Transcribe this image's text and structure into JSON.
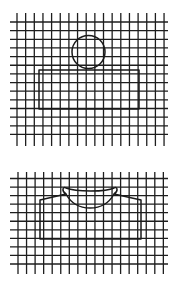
{
  "figures": [
    {
      "name": "circle-over-rectangle",
      "grid": {
        "h_lines": {
          "x1": 10,
          "x2": 168,
          "y_start": 22,
          "count": 14,
          "spacing": 8.65
        },
        "v_lines": {
          "y1": 13,
          "y2": 146,
          "x_start": 17,
          "count": 18,
          "spacing": 8.65
        }
      },
      "circle": {
        "cx": 88.5,
        "cy": 52,
        "r": 16.5
      },
      "rect": {
        "x": 39,
        "y": 70,
        "w": 100,
        "h": 39
      }
    },
    {
      "name": "garment-shape",
      "grid": {
        "h_lines": {
          "x1": 10,
          "x2": 168,
          "y_start": 178.5,
          "count": 11,
          "spacing": 8.55
        },
        "v_lines": {
          "y1": 172,
          "y2": 274,
          "x_start": 18,
          "count": 18,
          "spacing": 8.55
        }
      },
      "outline_path": "M40,200 L40,239 L141,239 L141,200 L114,194 C119,191 117,186 114,188 C106,192 76,192 66,188 C63,186 61,191 66,194 Z",
      "collar_path": "M66,194 C72,205 80,208 90,208 C100,208 108,205 114,194"
    }
  ]
}
